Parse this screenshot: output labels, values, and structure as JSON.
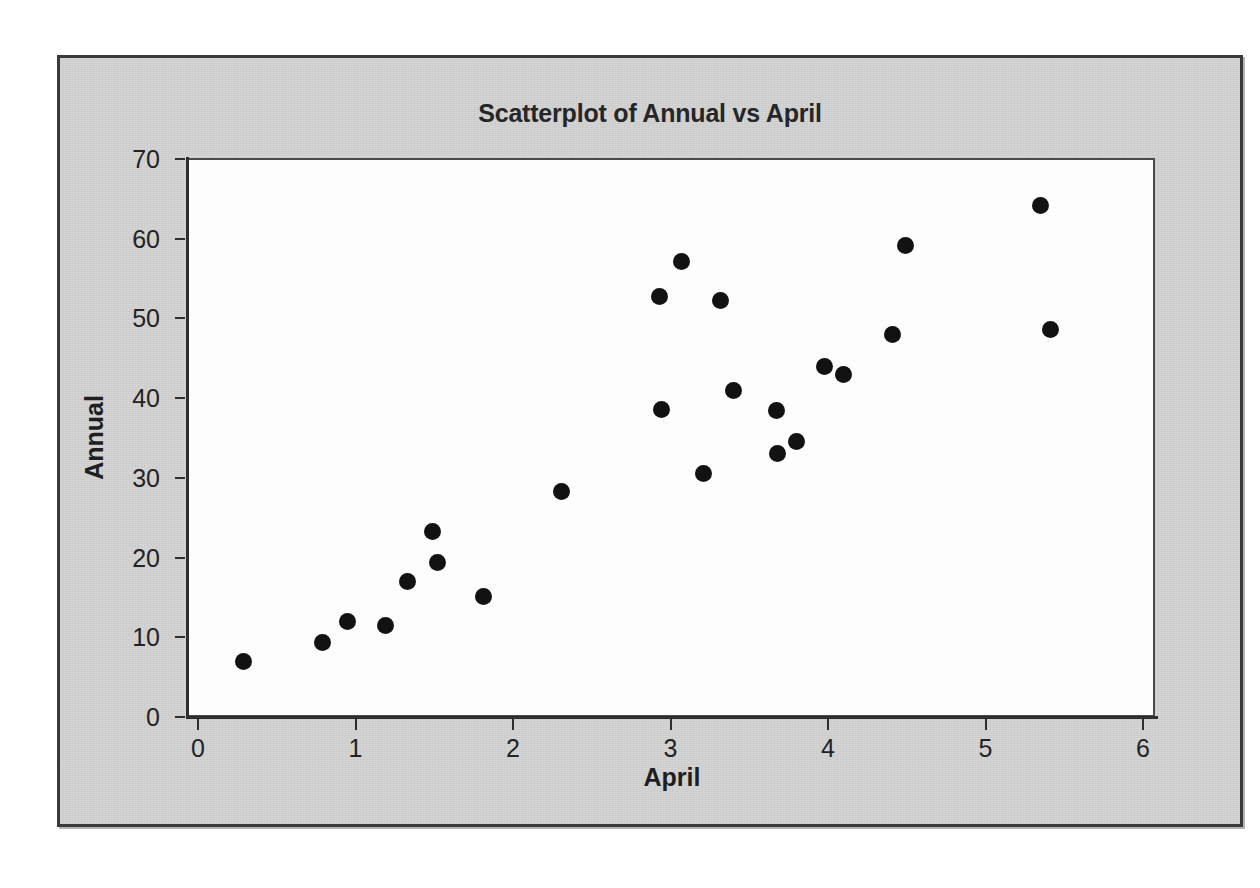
{
  "chart_data": {
    "type": "scatter",
    "title": "Scatterplot of Annual vs April",
    "xlabel": "April",
    "ylabel": "Annual",
    "xlim": [
      0,
      6
    ],
    "ylim": [
      0,
      70
    ],
    "xticks": [
      "0",
      "1",
      "2",
      "3",
      "4",
      "5",
      "6"
    ],
    "yticks": [
      "0",
      "10",
      "20",
      "30",
      "40",
      "50",
      "60",
      "70"
    ],
    "xtick_values": [
      0,
      1,
      2,
      3,
      4,
      5,
      6
    ],
    "ytick_values": [
      0,
      10,
      20,
      30,
      40,
      50,
      60,
      70
    ],
    "grid": false,
    "legend": null,
    "marker": {
      "shape": "circle",
      "color": "#121212",
      "size": 17
    },
    "points": [
      {
        "x": 0.29,
        "y": 7.0
      },
      {
        "x": 0.79,
        "y": 9.3
      },
      {
        "x": 0.95,
        "y": 12.0
      },
      {
        "x": 1.19,
        "y": 11.5
      },
      {
        "x": 1.33,
        "y": 17.0
      },
      {
        "x": 1.49,
        "y": 23.3
      },
      {
        "x": 1.52,
        "y": 19.4
      },
      {
        "x": 1.81,
        "y": 15.1
      },
      {
        "x": 2.31,
        "y": 28.3
      },
      {
        "x": 2.93,
        "y": 52.8
      },
      {
        "x": 2.94,
        "y": 38.6
      },
      {
        "x": 3.07,
        "y": 57.2
      },
      {
        "x": 3.21,
        "y": 30.5
      },
      {
        "x": 3.32,
        "y": 52.2
      },
      {
        "x": 3.4,
        "y": 41.0
      },
      {
        "x": 3.67,
        "y": 38.5
      },
      {
        "x": 3.68,
        "y": 33.1
      },
      {
        "x": 3.8,
        "y": 34.6
      },
      {
        "x": 3.98,
        "y": 44.0
      },
      {
        "x": 4.1,
        "y": 43.0
      },
      {
        "x": 4.41,
        "y": 48.0
      },
      {
        "x": 4.49,
        "y": 59.2
      },
      {
        "x": 5.35,
        "y": 64.2
      },
      {
        "x": 5.41,
        "y": 48.6
      }
    ]
  },
  "colors": {
    "frame_background": "#d4d4d4",
    "frame_border": "#3a3a3a",
    "plot_background": "#fdfdfd",
    "axis": "#2e2e2e",
    "marker": "#121212",
    "text": "#232323",
    "page_background": "#ffffff"
  }
}
